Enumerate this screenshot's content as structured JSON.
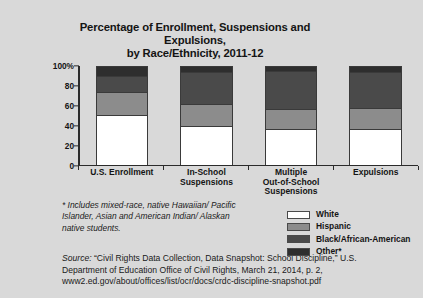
{
  "chart_data": {
    "type": "bar",
    "subtype": "stacked-percentage-column",
    "title": "Percentage of Enrollment, Suspensions and Expulsions, by Race/Ethnicity, 2011-12",
    "title_line1": "Percentage of Enrollment, Suspensions and Expulsions,",
    "title_line2": "by Race/Ethnicity, 2011-12",
    "xlabel": "",
    "ylabel": "",
    "ylim": [
      0,
      100
    ],
    "grid": false,
    "legend_position": "bottom-right",
    "categories": [
      "U.S. Enrollment",
      "In-School Suspensions",
      "Multiple Out-of-School Suspensions",
      "Expulsions"
    ],
    "category_lines": [
      [
        "U.S. Enrollment"
      ],
      [
        "In-School",
        "Suspensions"
      ],
      [
        "Multiple",
        "Out-of-School",
        "Suspensions"
      ],
      [
        "Expulsions"
      ]
    ],
    "ytick_labels": [
      "0",
      "20",
      "40",
      "60",
      "80",
      "100%"
    ],
    "ytick_values": [
      0,
      20,
      40,
      60,
      80,
      100
    ],
    "series": [
      {
        "name": "White",
        "color": "#ffffff",
        "values": [
          51,
          40,
          36,
          36
        ]
      },
      {
        "name": "Hispanic",
        "color": "#8c8c8c",
        "values": [
          24,
          22,
          21,
          22
        ]
      },
      {
        "name": "Black/African-American",
        "color": "#4a4a4a",
        "values": [
          16,
          33,
          39,
          37
        ]
      },
      {
        "name": "Other*",
        "color": "#2e2e2e",
        "values": [
          9,
          5,
          4,
          5
        ]
      }
    ],
    "legend": [
      {
        "label": "White",
        "color": "#ffffff"
      },
      {
        "label": "Hispanic",
        "color": "#8c8c8c"
      },
      {
        "label": "Black/African-American",
        "color": "#4a4a4a"
      },
      {
        "label": "Other*",
        "color": "#2e2e2e"
      }
    ]
  },
  "footnote": {
    "line1": "* Includes mixed-race, native Hawaiian/",
    "line2": "Pacific Islander, Asian and American Indian/",
    "line3": "Alaskan native students."
  },
  "source": {
    "label": "Source:",
    "line1_rest": " “Civil Rights Data Collection, Data",
    "line2": "Snapshot: School Discipline,” U.S. Department",
    "line3": "of Education Office of Civil Rights, March 21, 2014, p. 2,",
    "line4": "www2.ed.gov/about/offices/list/ocr/docs/crdc-discipline-snapshot.pdf"
  },
  "colors": {
    "background": "#d9d9d9",
    "plot_background": "#d9d9d9",
    "axis": "#2b2b2b",
    "text": "#141414"
  }
}
